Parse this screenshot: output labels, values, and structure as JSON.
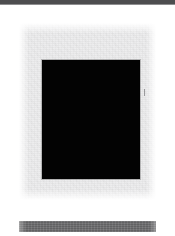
{
  "page": {
    "width": 175,
    "height": 236,
    "background_color": "#ffffff",
    "kind": "scanned-document-page"
  },
  "top_band": {
    "color": "#4d4d4f",
    "edge_color": "#8e8e90",
    "label": ""
  },
  "content_panel": {
    "color": "#ececed",
    "label": ""
  },
  "black_plate": {
    "color": "#030303",
    "border_color": "#787878",
    "label": ""
  },
  "margin_tick": {
    "color": "#5a5a5c",
    "label": ""
  },
  "bottom_bar": {
    "color": "#6b6b6d",
    "label": ""
  }
}
